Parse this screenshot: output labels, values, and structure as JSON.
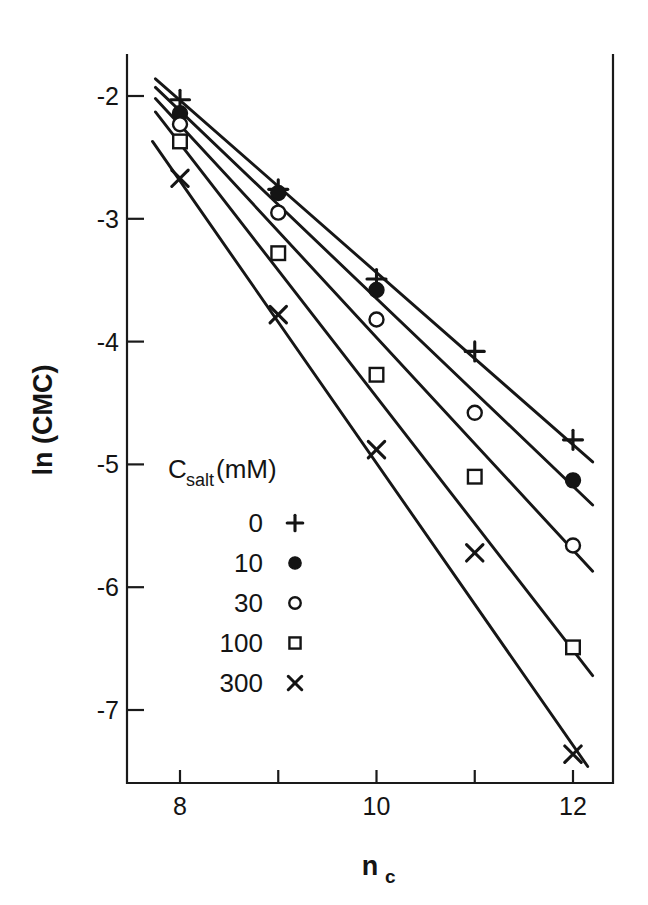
{
  "figure": {
    "background_color": "#ffffff",
    "ink_color": "#141414"
  },
  "axes": {
    "x_title": "n",
    "x_title_sub": "c",
    "y_title": "ln (CMC)",
    "x_tick_labels": [
      "8",
      "10",
      "12"
    ],
    "x_tick_values": [
      8,
      9,
      10,
      11,
      12
    ],
    "y_tick_labels": [
      "-2",
      "-3",
      "-4",
      "-5",
      "-6",
      "-7"
    ],
    "y_tick_values": [
      -2,
      -3,
      -4,
      -5,
      -6,
      -7
    ]
  },
  "legend": {
    "title_main": "C",
    "title_sub": "salt",
    "title_tail": "(mM)",
    "entries": [
      {
        "label": "0",
        "marker": "plus-marker"
      },
      {
        "label": "10",
        "marker": "filled-circle-marker"
      },
      {
        "label": "30",
        "marker": "open-circle-marker"
      },
      {
        "label": "100",
        "marker": "open-square-marker"
      },
      {
        "label": "300",
        "marker": "cross-marker"
      }
    ]
  },
  "chart_data": {
    "type": "scatter",
    "title": "",
    "xlabel": "n_c",
    "ylabel": "ln (CMC)",
    "xlim": [
      7.55,
      12.4
    ],
    "ylim": [
      -7.6,
      -1.65
    ],
    "grid": false,
    "legend_position": "inside-left",
    "x": [
      8,
      9,
      10,
      11,
      12
    ],
    "series": [
      {
        "name": "0",
        "marker": "plus-marker",
        "points": [
          {
            "x": 8,
            "y": -2.03
          },
          {
            "x": 9,
            "y": -2.76
          },
          {
            "x": 10,
            "y": -3.49
          },
          {
            "x": 11,
            "y": -4.08
          },
          {
            "x": 12,
            "y": -4.8
          }
        ],
        "fit_line": {
          "x0": 7.75,
          "y0": -1.86,
          "x1": 12.2,
          "y1": -4.98
        }
      },
      {
        "name": "10",
        "marker": "filled-circle-marker",
        "points": [
          {
            "x": 8,
            "y": -2.14
          },
          {
            "x": 9,
            "y": -2.79
          },
          {
            "x": 10,
            "y": -3.58
          },
          {
            "x": 12,
            "y": -5.13
          }
        ],
        "fit_line": {
          "x0": 7.75,
          "y0": -1.93,
          "x1": 12.2,
          "y1": -5.33
        }
      },
      {
        "name": "30",
        "marker": "open-circle-marker",
        "points": [
          {
            "x": 8,
            "y": -2.23
          },
          {
            "x": 9,
            "y": -2.95
          },
          {
            "x": 10,
            "y": -3.82
          },
          {
            "x": 11,
            "y": -4.58
          },
          {
            "x": 12,
            "y": -5.66
          }
        ],
        "fit_line": {
          "x0": 7.75,
          "y0": -2.02,
          "x1": 12.2,
          "y1": -5.87
        }
      },
      {
        "name": "100",
        "marker": "open-square-marker",
        "points": [
          {
            "x": 8,
            "y": -2.37
          },
          {
            "x": 9,
            "y": -3.28
          },
          {
            "x": 10,
            "y": -4.27
          },
          {
            "x": 11,
            "y": -5.1
          },
          {
            "x": 12,
            "y": -6.49
          }
        ],
        "fit_line": {
          "x0": 7.75,
          "y0": -2.13,
          "x1": 12.2,
          "y1": -6.72
        }
      },
      {
        "name": "300",
        "marker": "cross-marker",
        "points": [
          {
            "x": 8,
            "y": -2.67
          },
          {
            "x": 9,
            "y": -3.78
          },
          {
            "x": 10,
            "y": -4.88
          },
          {
            "x": 11,
            "y": -5.72
          },
          {
            "x": 12,
            "y": -7.36
          }
        ],
        "fit_line": {
          "x0": 7.72,
          "y0": -2.37,
          "x1": 12.15,
          "y1": -7.46
        }
      }
    ]
  }
}
